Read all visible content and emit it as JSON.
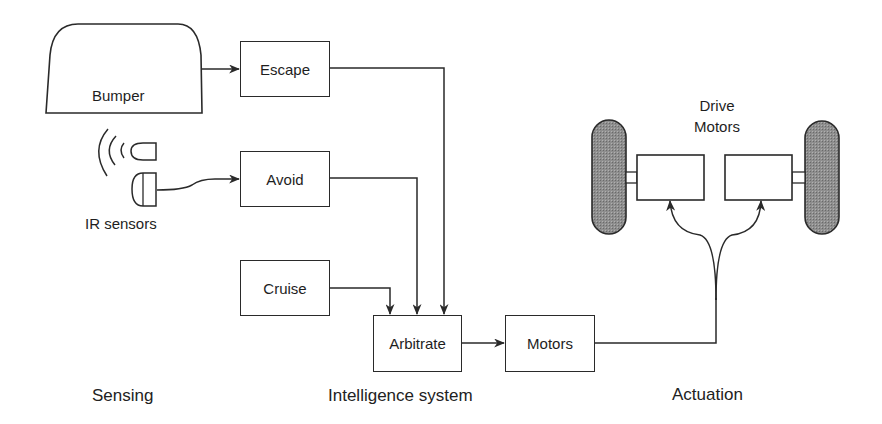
{
  "diagram": {
    "sections": [
      {
        "id": "sensing",
        "label": "Sensing"
      },
      {
        "id": "intelligence",
        "label": "Intelligence system"
      },
      {
        "id": "actuation",
        "label": "Actuation"
      }
    ],
    "sensors": {
      "bumper": {
        "label": "Bumper"
      },
      "ir": {
        "label": "IR sensors"
      }
    },
    "behaviors": {
      "escape": {
        "label": "Escape"
      },
      "avoid": {
        "label": "Avoid"
      },
      "cruise": {
        "label": "Cruise"
      }
    },
    "arbitrate": {
      "label": "Arbitrate"
    },
    "motors": {
      "label": "Motors"
    },
    "drive_motors": {
      "label_line1": "Drive",
      "label_line2": "Motors"
    },
    "connections": [
      {
        "from": "Bumper",
        "to": "Escape"
      },
      {
        "from": "IR sensors",
        "to": "Avoid"
      },
      {
        "from": "Escape",
        "to": "Arbitrate"
      },
      {
        "from": "Avoid",
        "to": "Arbitrate"
      },
      {
        "from": "Cruise",
        "to": "Arbitrate"
      },
      {
        "from": "Arbitrate",
        "to": "Motors"
      },
      {
        "from": "Motors",
        "to": "Drive Motors (left)"
      },
      {
        "from": "Motors",
        "to": "Drive Motors (right)"
      }
    ],
    "colors": {
      "line": "#2a2a2a",
      "wheel_fill": "#8a8a8a",
      "background": "#ffffff"
    }
  }
}
